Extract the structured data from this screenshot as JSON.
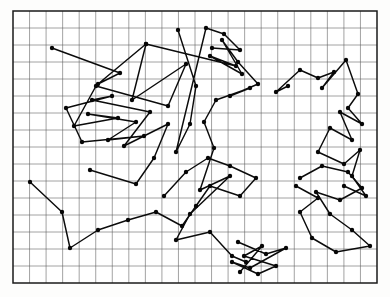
{
  "figure": {
    "type": "scatter-polyline-diagram",
    "background_color": "#ffffff",
    "line_color": "#0b0b0b",
    "node_color": "#070707",
    "grid_color": "#5d5d5d",
    "border_color": "#1a1a1a"
  },
  "chart_data": {
    "type": "line",
    "subtitle": "",
    "xlabel": "",
    "ylabel": "",
    "xlim": [
      0,
      22
    ],
    "ylim": [
      0,
      16
    ],
    "grid": true,
    "legend": "none",
    "tick_labels_x": [],
    "tick_labels_y": [],
    "annotations": [],
    "grid_columns": 22,
    "grid_rows": 16,
    "plot_box_px": {
      "x": 13,
      "y": 11,
      "width": 364,
      "height": 272
    },
    "marker": "filled-circle",
    "marker_radius_px": 2.2,
    "series": [
      {
        "name": "walk-segment-1",
        "points": [
          [
            52,
            48
          ],
          [
            120,
            73
          ],
          [
            98,
            84
          ],
          [
            146,
            44
          ],
          [
            132,
            100
          ],
          [
            186,
            64
          ],
          [
            168,
            106
          ],
          [
            96,
            86
          ],
          [
            74,
            126
          ],
          [
            118,
            118
          ],
          [
            88,
            114
          ],
          [
            136,
            122
          ],
          [
            108,
            140
          ],
          [
            144,
            136
          ],
          [
            82,
            142
          ],
          [
            66,
            108
          ],
          [
            112,
            96
          ],
          [
            92,
            100
          ],
          [
            150,
            112
          ],
          [
            124,
            146
          ],
          [
            168,
            124
          ],
          [
            154,
            158
          ],
          [
            136,
            184
          ],
          [
            90,
            170
          ]
        ]
      },
      {
        "name": "walk-segment-2",
        "points": [
          [
            146,
            44
          ],
          [
            236,
            66
          ],
          [
            210,
            56
          ],
          [
            242,
            74
          ],
          [
            222,
            40
          ],
          [
            238,
            62
          ],
          [
            258,
            84
          ],
          [
            230,
            96
          ],
          [
            250,
            88
          ],
          [
            216,
            100
          ],
          [
            204,
            122
          ],
          [
            214,
            148
          ],
          [
            200,
            190
          ],
          [
            230,
            176
          ],
          [
            190,
            214
          ],
          [
            176,
            240
          ],
          [
            210,
            232
          ],
          [
            232,
            256
          ],
          [
            246,
            262
          ]
        ]
      },
      {
        "name": "walk-segment-3",
        "points": [
          [
            288,
            86
          ],
          [
            276,
            92
          ],
          [
            300,
            70
          ],
          [
            318,
            78
          ],
          [
            334,
            72
          ],
          [
            322,
            88
          ],
          [
            346,
            60
          ],
          [
            358,
            94
          ],
          [
            348,
            108
          ],
          [
            362,
            124
          ],
          [
            340,
            112
          ],
          [
            352,
            140
          ],
          [
            330,
            128
          ],
          [
            318,
            152
          ],
          [
            344,
            164
          ],
          [
            360,
            150
          ],
          [
            352,
            176
          ],
          [
            366,
            196
          ],
          [
            344,
            186
          ]
        ]
      },
      {
        "name": "walk-segment-4",
        "points": [
          [
            300,
            178
          ],
          [
            322,
            166
          ],
          [
            348,
            172
          ],
          [
            362,
            188
          ],
          [
            340,
            200
          ],
          [
            316,
            192
          ],
          [
            330,
            214
          ],
          [
            352,
            230
          ],
          [
            370,
            246
          ],
          [
            336,
            252
          ],
          [
            312,
            238
          ],
          [
            300,
            212
          ],
          [
            318,
            198
          ],
          [
            296,
            186
          ]
        ]
      },
      {
        "name": "walk-segment-5",
        "points": [
          [
            30,
            182
          ],
          [
            62,
            212
          ],
          [
            70,
            248
          ],
          [
            98,
            230
          ],
          [
            128,
            220
          ],
          [
            156,
            212
          ],
          [
            182,
            226
          ],
          [
            196,
            206
          ],
          [
            210,
            186
          ],
          [
            240,
            196
          ],
          [
            256,
            178
          ],
          [
            230,
            166
          ],
          [
            208,
            158
          ],
          [
            186,
            172
          ],
          [
            164,
            196
          ]
        ]
      },
      {
        "name": "walk-segment-6",
        "points": [
          [
            238,
            242
          ],
          [
            266,
            254
          ],
          [
            286,
            248
          ],
          [
            250,
            268
          ],
          [
            232,
            262
          ],
          [
            258,
            274
          ],
          [
            276,
            266
          ],
          [
            244,
            256
          ],
          [
            262,
            246
          ],
          [
            240,
            272
          ]
        ]
      },
      {
        "name": "walk-segment-7",
        "points": [
          [
            178,
            30
          ],
          [
            196,
            86
          ],
          [
            190,
            124
          ],
          [
            176,
            152
          ],
          [
            206,
            28
          ],
          [
            224,
            34
          ],
          [
            240,
            50
          ],
          [
            212,
            48
          ]
        ]
      }
    ]
  },
  "accessibility": {
    "alt_text": "A bordered rectangular grid of small square cells containing a dense network of black dots connected by straight line segments, resembling a random walk or travelling-salesman tour."
  }
}
